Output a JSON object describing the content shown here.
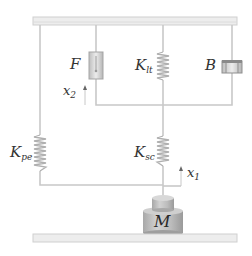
{
  "diagram": {
    "colors": {
      "line": "#c8c8c8",
      "plate_fill": "#ededed",
      "plate_edge": "#cfcfcf",
      "mass_fill": "#bdbdbd",
      "mass_dark": "#9e9e9e",
      "text": "#333333"
    },
    "labels": {
      "force": {
        "main": "F",
        "sub": ""
      },
      "k_lt": {
        "main": "K",
        "sub": "lt"
      },
      "damper": {
        "main": "B",
        "sub": ""
      },
      "k_pe": {
        "main": "K",
        "sub": "pe"
      },
      "k_sc": {
        "main": "K",
        "sub": "sc"
      },
      "mass": {
        "main": "M",
        "sub": ""
      },
      "x2": {
        "main": "x",
        "sub": "2"
      },
      "x1": {
        "main": "x",
        "sub": "1"
      }
    },
    "components": [
      {
        "id": "top-plate",
        "type": "fixed-support"
      },
      {
        "id": "F",
        "type": "force-generator",
        "label": "F"
      },
      {
        "id": "K_lt",
        "type": "spring",
        "label": "K_lt"
      },
      {
        "id": "B",
        "type": "damper",
        "label": "B"
      },
      {
        "id": "K_pe",
        "type": "spring",
        "label": "K_pe"
      },
      {
        "id": "K_sc",
        "type": "spring",
        "label": "K_sc"
      },
      {
        "id": "M",
        "type": "mass",
        "label": "M"
      },
      {
        "id": "bottom-plate",
        "type": "ground"
      }
    ],
    "displacements": [
      {
        "id": "x2",
        "label": "x2",
        "direction": "up"
      },
      {
        "id": "x1",
        "label": "x1",
        "direction": "up"
      }
    ]
  }
}
